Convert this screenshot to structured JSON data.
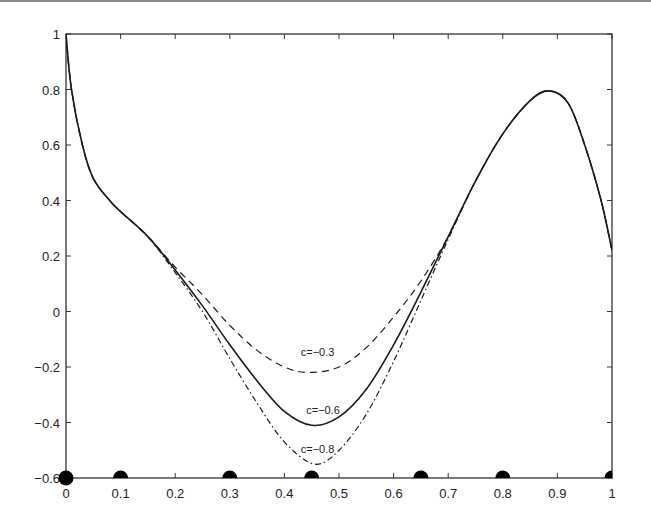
{
  "chart_data": {
    "type": "line",
    "title": "",
    "xlabel": "",
    "ylabel": "",
    "xlim": [
      0,
      1
    ],
    "ylim": [
      -0.6,
      1
    ],
    "grid": false,
    "legend": "none (inline curve labels)",
    "x_ticks": [
      "0",
      "0.1",
      "0.2",
      "0.3",
      "0.4",
      "0.5",
      "0.6",
      "0.7",
      "0.8",
      "0.9",
      "1"
    ],
    "y_ticks": [
      "-0.6",
      "-0.4",
      "-0.2",
      "0",
      "0.2",
      "0.4",
      "0.6",
      "0.8",
      "1"
    ],
    "series": [
      {
        "name": "c=-0.3",
        "style": "dashed",
        "x": [
          0.0,
          0.01,
          0.03,
          0.05,
          0.08,
          0.1,
          0.15,
          0.2,
          0.25,
          0.3,
          0.35,
          0.4,
          0.445,
          0.5,
          0.55,
          0.6,
          0.65,
          0.7,
          0.75,
          0.8,
          0.85,
          0.885,
          0.92,
          0.95,
          0.98,
          1.0
        ],
        "y": [
          1.0,
          0.8,
          0.6,
          0.48,
          0.4,
          0.36,
          0.27,
          0.16,
          0.06,
          -0.05,
          -0.14,
          -0.2,
          -0.22,
          -0.2,
          -0.13,
          -0.02,
          0.11,
          0.27,
          0.47,
          0.64,
          0.76,
          0.795,
          0.75,
          0.6,
          0.4,
          0.22
        ]
      },
      {
        "name": "c=-0.6",
        "style": "solid",
        "x": [
          0.0,
          0.01,
          0.03,
          0.05,
          0.08,
          0.1,
          0.15,
          0.2,
          0.25,
          0.3,
          0.35,
          0.4,
          0.45,
          0.5,
          0.55,
          0.6,
          0.65,
          0.7,
          0.75,
          0.8,
          0.85,
          0.885,
          0.92,
          0.95,
          0.98,
          1.0
        ],
        "y": [
          1.0,
          0.8,
          0.6,
          0.48,
          0.4,
          0.36,
          0.27,
          0.15,
          0.02,
          -0.12,
          -0.25,
          -0.36,
          -0.41,
          -0.38,
          -0.28,
          -0.12,
          0.07,
          0.27,
          0.47,
          0.64,
          0.76,
          0.795,
          0.75,
          0.6,
          0.4,
          0.22
        ]
      },
      {
        "name": "c=-0.8",
        "style": "dash-dot",
        "x": [
          0.0,
          0.01,
          0.03,
          0.05,
          0.08,
          0.1,
          0.15,
          0.2,
          0.25,
          0.3,
          0.35,
          0.4,
          0.455,
          0.5,
          0.55,
          0.6,
          0.65,
          0.7,
          0.75,
          0.8,
          0.85,
          0.885,
          0.92,
          0.95,
          0.98,
          1.0
        ],
        "y": [
          1.0,
          0.8,
          0.6,
          0.48,
          0.4,
          0.36,
          0.27,
          0.14,
          0.0,
          -0.17,
          -0.33,
          -0.47,
          -0.55,
          -0.5,
          -0.37,
          -0.18,
          0.04,
          0.26,
          0.47,
          0.64,
          0.76,
          0.795,
          0.75,
          0.6,
          0.4,
          0.22
        ]
      }
    ],
    "markers": {
      "style": "filled black circles on x-axis at y=-0.6",
      "x": [
        0,
        0.1,
        0.3,
        0.45,
        0.65,
        0.8,
        1
      ],
      "y": -0.6
    },
    "annotations": [
      {
        "text": "c=-0.3",
        "x": 0.43,
        "y": -0.16
      },
      {
        "text": "c=-0.6",
        "x": 0.44,
        "y": -0.37
      },
      {
        "text": "c=-0.8",
        "x": 0.43,
        "y": -0.51
      }
    ]
  }
}
